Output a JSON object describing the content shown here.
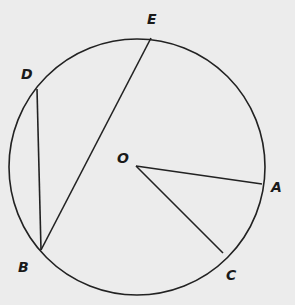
{
  "diagram": {
    "type": "circle-geometry",
    "colors": {
      "background": "#ececec",
      "stroke": "#222222",
      "label": "#1a1a1a"
    },
    "circle": {
      "name": "circle",
      "cx": 137,
      "cy": 167,
      "r": 128
    },
    "points": {
      "E": {
        "label": "E",
        "x": 151,
        "y": 38,
        "lx": 147,
        "ly": 24
      },
      "D": {
        "label": "D",
        "x": 37,
        "y": 89,
        "lx": 21,
        "ly": 79
      },
      "B": {
        "label": "B",
        "x": 41,
        "y": 250,
        "lx": 18,
        "ly": 272
      },
      "O": {
        "label": "O",
        "x": 136,
        "y": 166,
        "lx": 117,
        "ly": 163
      },
      "A": {
        "label": "A",
        "x": 262,
        "y": 184,
        "lx": 271,
        "ly": 192
      },
      "C": {
        "label": "C",
        "x": 223,
        "y": 253,
        "lx": 226,
        "ly": 280
      }
    },
    "segments": [
      {
        "name": "chord-DB",
        "from": "D",
        "to": "B"
      },
      {
        "name": "chord-BE",
        "from": "B",
        "to": "E"
      },
      {
        "name": "radius-OA",
        "from": "O",
        "to": "A"
      },
      {
        "name": "radius-OC",
        "from": "O",
        "to": "C"
      }
    ]
  }
}
